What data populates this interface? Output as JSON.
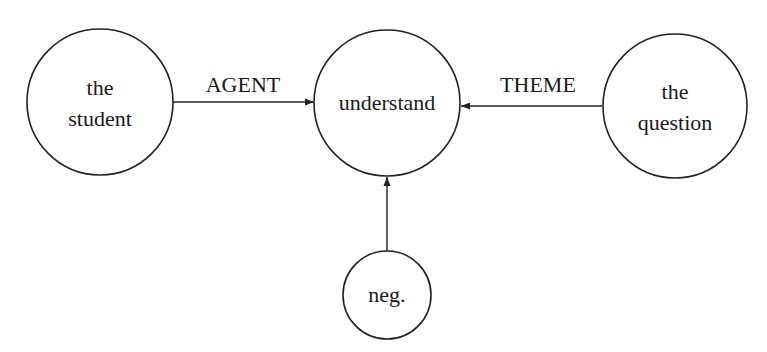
{
  "diagram": {
    "type": "semantic-graph",
    "nodes": [
      {
        "id": "student",
        "lines": [
          "the",
          "student"
        ],
        "cx": 100,
        "cy": 102,
        "r": 73
      },
      {
        "id": "understand",
        "lines": [
          "understand"
        ],
        "cx": 387,
        "cy": 103,
        "r": 73
      },
      {
        "id": "question",
        "lines": [
          "the",
          "question"
        ],
        "cx": 675,
        "cy": 106,
        "r": 72
      },
      {
        "id": "neg",
        "lines": [
          "neg."
        ],
        "cx": 387,
        "cy": 295,
        "r": 44
      }
    ],
    "edges": [
      {
        "from": "student",
        "to": "understand",
        "label": "AGENT"
      },
      {
        "from": "question",
        "to": "understand",
        "label": "THEME"
      },
      {
        "from": "neg",
        "to": "understand",
        "label": ""
      }
    ]
  },
  "labels": {
    "student_line1": "the",
    "student_line2": "student",
    "understand": "understand",
    "question_line1": "the",
    "question_line2": "question",
    "neg": "neg.",
    "agent": "AGENT",
    "theme": "THEME"
  },
  "colors": {
    "stroke": "#222222",
    "text": "#1a1a1a",
    "background": "#ffffff"
  }
}
